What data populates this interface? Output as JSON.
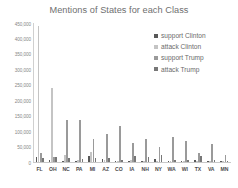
{
  "chart_data": {
    "type": "bar",
    "title": "Mentions of States for each Class",
    "xlabel": "",
    "ylabel": "",
    "ylim": [
      0,
      450000
    ],
    "grid": false,
    "legend_position": "top-right",
    "categories": [
      "FL",
      "OH",
      "NC",
      "PA",
      "MI",
      "AZ",
      "CO",
      "IA",
      "NH",
      "NY",
      "WA",
      "WI",
      "TX",
      "VA",
      "MN"
    ],
    "ytick_labels": [
      "0",
      "50,000",
      "100,000",
      "150,000",
      "200,000",
      "250,000",
      "300,000",
      "350,000",
      "400,000",
      "450,000"
    ],
    "ytick_values": [
      0,
      50000,
      100000,
      150000,
      200000,
      250000,
      300000,
      350000,
      400000,
      450000
    ],
    "series": [
      {
        "name": "support Clinton",
        "color": "#585858",
        "values": [
          17000,
          5000,
          2500,
          2000,
          20000,
          11000,
          2000,
          1500,
          2000,
          11000,
          1500,
          1500,
          8000,
          1500,
          1000
        ]
      },
      {
        "name": "attack Clinton",
        "color": "#c4c4c4",
        "values": [
          440000,
          240000,
          23000,
          8000,
          32000,
          7000,
          3000,
          8000,
          3000,
          3000,
          2000,
          2000,
          2000,
          2000,
          2000
        ]
      },
      {
        "name": "support Trump",
        "color": "#9a9a9a",
        "values": [
          28000,
          17000,
          135000,
          137000,
          75000,
          92000,
          115000,
          62000,
          74000,
          48000,
          80000,
          67000,
          30000,
          58000,
          22000
        ]
      },
      {
        "name": "attack Trump",
        "color": "#777777",
        "values": [
          14000,
          16000,
          13000,
          10000,
          12000,
          12000,
          7000,
          18000,
          17000,
          24000,
          8000,
          5000,
          18000,
          6000,
          3000
        ]
      }
    ]
  }
}
